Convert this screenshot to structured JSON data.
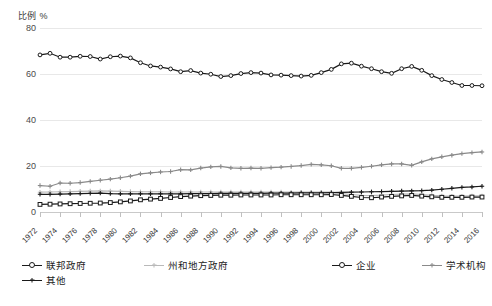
{
  "axes": {
    "y_unit_label": "比例 %",
    "y_ticks": [
      0,
      20,
      40,
      60,
      80
    ],
    "x_ticks": [
      "1972",
      "1974",
      "1976",
      "1978",
      "1980",
      "1982",
      "1984",
      "1986",
      "1988",
      "1990",
      "1992",
      "1994",
      "1996",
      "1998",
      "2000",
      "2002",
      "2004",
      "2006",
      "2008",
      "2010",
      "2012",
      "2014",
      "2016"
    ]
  },
  "legend": {
    "items": [
      {
        "label": "联邦政府",
        "color": "#1a1a1a",
        "marker": "open-circle",
        "name": "legend-item-federal"
      },
      {
        "label": "州和地方政府",
        "color": "#b9b9b9",
        "marker": "plus",
        "name": "legend-item-state-local"
      },
      {
        "label": "企业",
        "color": "#1a1a1a",
        "marker": "open-circle",
        "name": "legend-item-business"
      },
      {
        "label": "学术机构",
        "color": "#8a8a8a",
        "marker": "plus",
        "name": "legend-item-academic"
      },
      {
        "label": "其他",
        "color": "#1a1a1a",
        "marker": "plus",
        "name": "legend-item-other"
      }
    ]
  },
  "chart_data": {
    "type": "line",
    "title": "",
    "xlabel": "",
    "ylabel": "比例 %",
    "ylim": [
      0,
      80
    ],
    "grid": true,
    "legend_position": "bottom",
    "x": [
      1972,
      1973,
      1974,
      1975,
      1976,
      1977,
      1978,
      1979,
      1980,
      1981,
      1982,
      1983,
      1984,
      1985,
      1986,
      1987,
      1988,
      1989,
      1990,
      1991,
      1992,
      1993,
      1994,
      1995,
      1996,
      1997,
      1998,
      1999,
      2000,
      2001,
      2002,
      2003,
      2004,
      2005,
      2006,
      2007,
      2008,
      2009,
      2010,
      2011,
      2012,
      2013,
      2014,
      2015,
      2016
    ],
    "series": [
      {
        "name": "企业",
        "color": "#1a1a1a",
        "marker": "open-circle",
        "values": [
          68.3,
          69.0,
          67.3,
          67.3,
          67.7,
          67.6,
          66.5,
          67.5,
          67.8,
          67.0,
          64.9,
          63.5,
          63.0,
          62.2,
          61.0,
          61.5,
          60.4,
          59.9,
          58.9,
          59.3,
          60.2,
          60.6,
          60.4,
          59.6,
          59.5,
          59.3,
          59.1,
          59.4,
          60.6,
          62.0,
          64.4,
          64.7,
          63.4,
          62.3,
          61.0,
          60.3,
          62.3,
          63.3,
          61.6,
          59.3,
          57.6,
          56.3,
          55.0,
          55.0,
          54.9
        ]
      },
      {
        "name": "学术机构",
        "color": "#8a8a8a",
        "marker": "plus",
        "values": [
          11.5,
          11.2,
          12.6,
          12.5,
          12.8,
          13.3,
          13.8,
          14.3,
          14.9,
          15.6,
          16.6,
          17.0,
          17.4,
          17.6,
          18.4,
          18.3,
          19.1,
          19.6,
          19.8,
          19.2,
          19.0,
          19.1,
          19.0,
          19.3,
          19.5,
          19.8,
          20.2,
          20.7,
          20.5,
          20.1,
          19.0,
          19.0,
          19.4,
          19.9,
          20.5,
          20.9,
          20.9,
          20.3,
          21.8,
          23.1,
          24.0,
          24.7,
          25.4,
          25.8,
          26.1
        ]
      },
      {
        "name": "州和地方政府",
        "color": "#b9b9b9",
        "marker": "plus",
        "values": [
          8.6,
          8.7,
          8.8,
          8.9,
          9.0,
          9.1,
          9.2,
          9.1,
          9.0,
          8.9,
          8.8,
          8.8,
          8.8,
          8.7,
          8.7,
          8.7,
          8.7,
          8.7,
          8.7,
          8.7,
          8.7,
          8.7,
          8.7,
          8.7,
          8.7,
          8.6,
          8.6,
          8.6,
          8.6,
          8.6,
          8.0,
          7.6,
          7.2,
          7.1,
          7.3,
          7.6,
          7.8,
          7.9,
          7.6,
          7.2,
          7.0,
          6.9,
          6.9,
          7.0,
          7.0
        ]
      },
      {
        "name": "其他",
        "color": "#1a1a1a",
        "marker": "plus",
        "values": [
          7.7,
          7.7,
          7.8,
          7.9,
          8.0,
          8.1,
          8.2,
          8.0,
          7.9,
          7.9,
          7.9,
          7.9,
          7.9,
          7.9,
          7.9,
          8.0,
          8.0,
          8.0,
          8.1,
          8.1,
          8.1,
          8.1,
          8.1,
          8.2,
          8.2,
          8.2,
          8.3,
          8.3,
          8.3,
          8.4,
          8.5,
          8.6,
          8.7,
          8.8,
          8.9,
          9.0,
          9.1,
          9.2,
          9.3,
          9.5,
          9.9,
          10.3,
          10.7,
          10.9,
          11.2
        ]
      },
      {
        "name": "联邦政府",
        "color": "#1a1a1a",
        "marker": "open-square",
        "values": [
          3.3,
          3.4,
          3.5,
          3.6,
          3.7,
          3.8,
          3.9,
          4.1,
          4.4,
          4.8,
          5.3,
          5.6,
          5.9,
          6.3,
          6.7,
          6.9,
          7.1,
          7.2,
          7.3,
          7.3,
          7.4,
          7.4,
          7.4,
          7.4,
          7.5,
          7.5,
          7.5,
          7.5,
          7.5,
          7.6,
          7.2,
          6.8,
          6.3,
          6.2,
          6.5,
          6.8,
          7.0,
          7.2,
          6.9,
          6.6,
          6.4,
          6.4,
          6.4,
          6.5,
          6.5
        ]
      }
    ]
  }
}
